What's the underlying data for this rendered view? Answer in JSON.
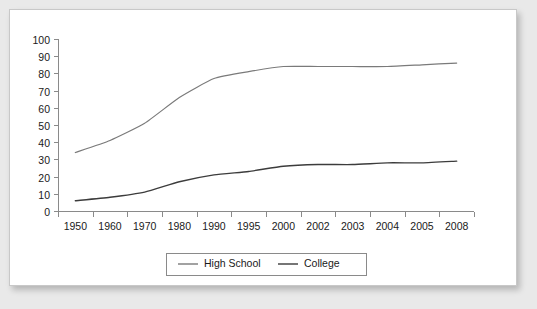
{
  "chart_data": {
    "type": "line",
    "title": "",
    "xlabel": "",
    "ylabel": "",
    "ylim": [
      0,
      100
    ],
    "ytick_step": 10,
    "yticks": [
      "0",
      "10",
      "20",
      "30",
      "40",
      "50",
      "60",
      "70",
      "80",
      "90",
      "100"
    ],
    "grid": false,
    "legend_position": "bottom-center",
    "categories": [
      "1950",
      "1960",
      "1970",
      "1980",
      "1990",
      "1995",
      "2000",
      "2002",
      "2003",
      "2004",
      "2005",
      "2008"
    ],
    "series": [
      {
        "name": "High School",
        "color": "#7a7a7a",
        "values": [
          34,
          41,
          51,
          66,
          77,
          81,
          84,
          84,
          84,
          84,
          85,
          86
        ]
      },
      {
        "name": "College",
        "color": "#3c3c3c",
        "values": [
          6,
          8,
          11,
          17,
          21,
          23,
          26,
          27,
          27,
          28,
          28,
          29
        ]
      }
    ]
  },
  "legend": {
    "items": [
      {
        "label": "High School",
        "color": "#7a7a7a"
      },
      {
        "label": "College",
        "color": "#3c3c3c"
      }
    ]
  },
  "colors": {
    "page_background": "#e9e9e9",
    "card_background": "#ffffff",
    "axis": "#8a8a8a",
    "text": "#1a1a1a",
    "high_school_line": "#7a7a7a",
    "college_line": "#3c3c3c"
  }
}
